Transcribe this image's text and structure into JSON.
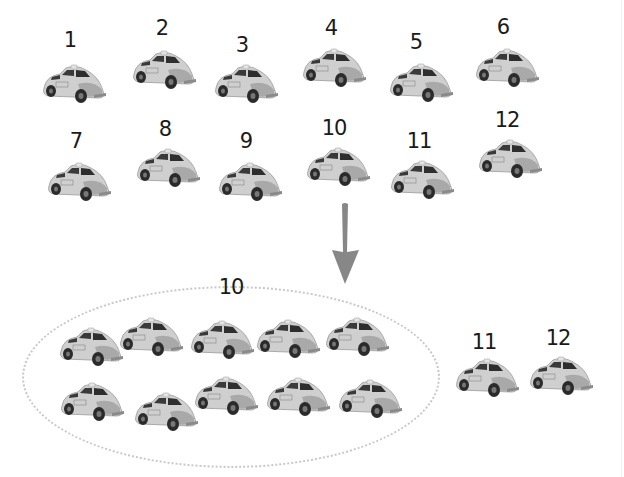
{
  "top_rows": [
    {
      "label": "1",
      "x": 70,
      "ly": 30,
      "cx": 38,
      "cy": 62
    },
    {
      "label": "2",
      "x": 162,
      "ly": 18,
      "cx": 128,
      "cy": 48
    },
    {
      "label": "3",
      "x": 242,
      "ly": 35,
      "cx": 210,
      "cy": 62
    },
    {
      "label": "4",
      "x": 331,
      "ly": 18,
      "cx": 298,
      "cy": 46
    },
    {
      "label": "5",
      "x": 416,
      "ly": 32,
      "cx": 385,
      "cy": 61
    },
    {
      "label": "6",
      "x": 503,
      "ly": 17,
      "cx": 471,
      "cy": 46
    },
    {
      "label": "7",
      "x": 76,
      "ly": 131,
      "cx": 43,
      "cy": 160
    },
    {
      "label": "8",
      "x": 165,
      "ly": 119,
      "cx": 132,
      "cy": 146
    },
    {
      "label": "9",
      "x": 246,
      "ly": 131,
      "cx": 214,
      "cy": 160
    },
    {
      "label": "10",
      "x": 334,
      "ly": 118,
      "cx": 302,
      "cy": 145
    },
    {
      "label": "11",
      "x": 419,
      "ly": 131,
      "cx": 386,
      "cy": 158
    },
    {
      "label": "12",
      "x": 507,
      "ly": 110,
      "cx": 474,
      "cy": 137
    }
  ],
  "group": {
    "label": "10",
    "label_x": 231,
    "label_y": 277,
    "cars": [
      {
        "cx": 55,
        "cy": 325
      },
      {
        "cx": 115,
        "cy": 315
      },
      {
        "cx": 186,
        "cy": 318
      },
      {
        "cx": 252,
        "cy": 317
      },
      {
        "cx": 321,
        "cy": 315
      },
      {
        "cx": 56,
        "cy": 380
      },
      {
        "cx": 130,
        "cy": 390
      },
      {
        "cx": 190,
        "cy": 374
      },
      {
        "cx": 262,
        "cy": 375
      },
      {
        "cx": 334,
        "cy": 377
      }
    ]
  },
  "remaining": [
    {
      "label": "11",
      "x": 484,
      "ly": 332,
      "cx": 451,
      "cy": 356
    },
    {
      "label": "12",
      "x": 558,
      "ly": 328,
      "cx": 525,
      "cy": 354
    }
  ],
  "arrow": {
    "icon": "down-arrow-icon",
    "color": "#7a7a7a"
  },
  "colors": {
    "car_body": "#c9c9c9",
    "car_dark": "#2b2b2b",
    "text": "#1a1a1a",
    "oval": "#c8c8c8"
  }
}
